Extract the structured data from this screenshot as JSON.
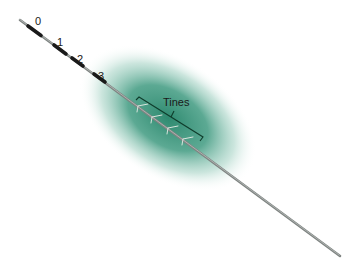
{
  "diagram": {
    "depth_markers": [
      "0",
      "1",
      "2",
      "3"
    ],
    "callout_label": "Tines",
    "colors": {
      "tissue_glow": "#2f8a70",
      "lead": "#8a8a8a",
      "marker_band": "#1a1a1a",
      "bracket": "#0f3d2c",
      "tines": "#d8e4dc"
    }
  }
}
